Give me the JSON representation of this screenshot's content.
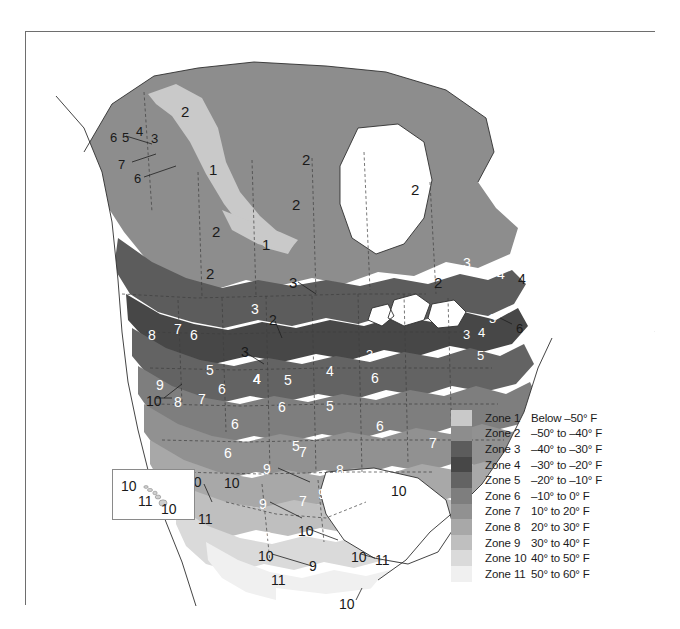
{
  "figure": {
    "kind": "choropleth-map",
    "palette": "grayscale"
  },
  "map": {
    "background_color": "#ffffff",
    "border_color": "#6e6e6e",
    "coastline_color": "#2b2b2b",
    "boundary_color": "#3a3a3a",
    "zone_fill_colors": {
      "1": "#c9c9c9",
      "2": "#8d8d8d",
      "3": "#5c5c5c",
      "4": "#4a4a4a",
      "5": "#606060",
      "6": "#7b7b7b",
      "7": "#8f8f8f",
      "8": "#a6a6a6",
      "9": "#bdbdbd",
      "10": "#d8d8d8",
      "11": "#efefef"
    },
    "labels": [
      {
        "text": "6",
        "x": 84,
        "y": 99,
        "size": 13,
        "tone": "dark"
      },
      {
        "text": "5",
        "x": 96,
        "y": 99,
        "size": 13,
        "tone": "dark"
      },
      {
        "text": "4",
        "x": 110,
        "y": 93,
        "size": 13,
        "tone": "dark"
      },
      {
        "text": "3",
        "x": 125,
        "y": 100,
        "size": 13,
        "tone": "dark"
      },
      {
        "text": "7",
        "x": 92,
        "y": 126,
        "size": 13,
        "tone": "dark"
      },
      {
        "text": "6",
        "x": 108,
        "y": 140,
        "size": 13,
        "tone": "dark"
      },
      {
        "text": "2",
        "x": 155,
        "y": 72,
        "size": 15,
        "tone": "dark"
      },
      {
        "text": "1",
        "x": 183,
        "y": 130,
        "size": 15,
        "tone": "dark"
      },
      {
        "text": "2",
        "x": 276,
        "y": 120,
        "size": 15,
        "tone": "dark"
      },
      {
        "text": "2",
        "x": 385,
        "y": 150,
        "size": 15,
        "tone": "dark"
      },
      {
        "text": "2",
        "x": 266,
        "y": 165,
        "size": 15,
        "tone": "dark"
      },
      {
        "text": "2",
        "x": 186,
        "y": 192,
        "size": 15,
        "tone": "dark"
      },
      {
        "text": "1",
        "x": 236,
        "y": 205,
        "size": 15,
        "tone": "dark"
      },
      {
        "text": "2",
        "x": 180,
        "y": 234,
        "size": 15,
        "tone": "dark"
      },
      {
        "text": "3",
        "x": 263,
        "y": 243,
        "size": 15,
        "tone": "dark"
      },
      {
        "text": "3",
        "x": 225,
        "y": 270,
        "size": 14,
        "tone": "light"
      },
      {
        "text": "2",
        "x": 243,
        "y": 281,
        "size": 14,
        "tone": "dark"
      },
      {
        "text": "3",
        "x": 385,
        "y": 267,
        "size": 14,
        "tone": "light"
      },
      {
        "text": "2",
        "x": 408,
        "y": 243,
        "size": 15,
        "tone": "dark"
      },
      {
        "text": "3",
        "x": 437,
        "y": 224,
        "size": 14,
        "tone": "light"
      },
      {
        "text": "4",
        "x": 471,
        "y": 235,
        "size": 14,
        "tone": "light"
      },
      {
        "text": "4",
        "x": 492,
        "y": 240,
        "size": 14,
        "tone": "dark"
      },
      {
        "text": "5",
        "x": 494,
        "y": 260,
        "size": 14,
        "tone": "light"
      },
      {
        "text": "3",
        "x": 463,
        "y": 280,
        "size": 13,
        "tone": "light"
      },
      {
        "text": "6",
        "x": 490,
        "y": 290,
        "size": 13,
        "tone": "dark"
      },
      {
        "text": "3",
        "x": 437,
        "y": 296,
        "size": 13,
        "tone": "light"
      },
      {
        "text": "4",
        "x": 452,
        "y": 294,
        "size": 13,
        "tone": "light"
      },
      {
        "text": "3",
        "x": 340,
        "y": 316,
        "size": 13,
        "tone": "light"
      },
      {
        "text": "5",
        "x": 451,
        "y": 317,
        "size": 13,
        "tone": "light"
      },
      {
        "text": "8",
        "x": 122,
        "y": 296,
        "size": 14,
        "tone": "light"
      },
      {
        "text": "7",
        "x": 148,
        "y": 290,
        "size": 14,
        "tone": "light"
      },
      {
        "text": "6",
        "x": 164,
        "y": 296,
        "size": 14,
        "tone": "light"
      },
      {
        "text": "3",
        "x": 215,
        "y": 313,
        "size": 14,
        "tone": "dark"
      },
      {
        "text": "5",
        "x": 180,
        "y": 331,
        "size": 14,
        "tone": "light"
      },
      {
        "text": "4",
        "x": 227,
        "y": 340,
        "size": 14,
        "tone": "light"
      },
      {
        "text": "4",
        "x": 227,
        "y": 340,
        "size": 14,
        "tone": "light"
      },
      {
        "text": "6",
        "x": 192,
        "y": 350,
        "size": 14,
        "tone": "light"
      },
      {
        "text": "4",
        "x": 227,
        "y": 340,
        "size": 14,
        "tone": "light"
      },
      {
        "text": "5",
        "x": 258,
        "y": 341,
        "size": 14,
        "tone": "light"
      },
      {
        "text": "4",
        "x": 300,
        "y": 332,
        "size": 14,
        "tone": "light"
      },
      {
        "text": "5",
        "x": 300,
        "y": 367,
        "size": 14,
        "tone": "light"
      },
      {
        "text": "6",
        "x": 252,
        "y": 368,
        "size": 14,
        "tone": "light"
      },
      {
        "text": "6",
        "x": 345,
        "y": 339,
        "size": 14,
        "tone": "light"
      },
      {
        "text": "6",
        "x": 350,
        "y": 387,
        "size": 14,
        "tone": "light"
      },
      {
        "text": "5",
        "x": 266,
        "y": 407,
        "size": 14,
        "tone": "light"
      },
      {
        "text": "6",
        "x": 205,
        "y": 385,
        "size": 14,
        "tone": "light"
      },
      {
        "text": "7",
        "x": 273,
        "y": 413,
        "size": 14,
        "tone": "light"
      },
      {
        "text": "7",
        "x": 403,
        "y": 404,
        "size": 14,
        "tone": "light"
      },
      {
        "text": "8",
        "x": 310,
        "y": 431,
        "size": 14,
        "tone": "light"
      },
      {
        "text": "9",
        "x": 130,
        "y": 346,
        "size": 14,
        "tone": "light"
      },
      {
        "text": "8",
        "x": 148,
        "y": 363,
        "size": 14,
        "tone": "light"
      },
      {
        "text": "7",
        "x": 172,
        "y": 360,
        "size": 14,
        "tone": "light"
      },
      {
        "text": "10",
        "x": 120,
        "y": 362,
        "size": 14,
        "tone": "dark"
      },
      {
        "text": "6",
        "x": 198,
        "y": 414,
        "size": 14,
        "tone": "light"
      },
      {
        "text": "9",
        "x": 237,
        "y": 430,
        "size": 14,
        "tone": "light"
      },
      {
        "text": "9",
        "x": 292,
        "y": 455,
        "size": 14,
        "tone": "light"
      },
      {
        "text": "9",
        "x": 233,
        "y": 465,
        "size": 14,
        "tone": "light"
      },
      {
        "text": "7",
        "x": 273,
        "y": 462,
        "size": 14,
        "tone": "light"
      },
      {
        "text": "10",
        "x": 365,
        "y": 452,
        "size": 14,
        "tone": "dark"
      },
      {
        "text": "10",
        "x": 198,
        "y": 444,
        "size": 14,
        "tone": "dark"
      },
      {
        "text": "11",
        "x": 172,
        "y": 480,
        "size": 14,
        "tone": "dark"
      },
      {
        "text": "10",
        "x": 160,
        "y": 443,
        "size": 14,
        "tone": "dark"
      },
      {
        "text": "8",
        "x": 238,
        "y": 498,
        "size": 14,
        "tone": "light"
      },
      {
        "text": "10",
        "x": 272,
        "y": 492,
        "size": 14,
        "tone": "dark"
      },
      {
        "text": "10",
        "x": 232,
        "y": 517,
        "size": 14,
        "tone": "dark"
      },
      {
        "text": "9",
        "x": 283,
        "y": 527,
        "size": 14,
        "tone": "dark"
      },
      {
        "text": "11",
        "x": 245,
        "y": 541,
        "size": 14,
        "tone": "dark"
      },
      {
        "text": "10",
        "x": 325,
        "y": 518,
        "size": 14,
        "tone": "dark"
      },
      {
        "text": "11",
        "x": 349,
        "y": 521,
        "size": 14,
        "tone": "dark"
      },
      {
        "text": "10",
        "x": 313,
        "y": 565,
        "size": 14,
        "tone": "dark"
      }
    ],
    "inset": {
      "name": "hawaii-inset",
      "labels": [
        {
          "text": "10",
          "x": 8,
          "y": 9,
          "size": 14,
          "tone": "dark"
        },
        {
          "text": "11",
          "x": 25,
          "y": 24,
          "size": 14,
          "tone": "dark"
        },
        {
          "text": "10",
          "x": 48,
          "y": 32,
          "size": 14,
          "tone": "dark"
        }
      ]
    }
  },
  "legend": {
    "title": "",
    "rows": [
      {
        "zone": "Zone 1",
        "range": "Below –50° F",
        "color": "#c9c9c9"
      },
      {
        "zone": "Zone 2",
        "range": "–50° to –40° F",
        "color": "#8d8d8d"
      },
      {
        "zone": "Zone 3",
        "range": "–40° to –30° F",
        "color": "#5c5c5c"
      },
      {
        "zone": "Zone 4",
        "range": "–30° to –20° F",
        "color": "#474747"
      },
      {
        "zone": "Zone 5",
        "range": "–20° to –10° F",
        "color": "#636363"
      },
      {
        "zone": "Zone 6",
        "range": "–10° to 0° F",
        "color": "#7e7e7e"
      },
      {
        "zone": "Zone 7",
        "range": "10° to 20° F",
        "color": "#919191"
      },
      {
        "zone": "Zone 8",
        "range": "20° to 30° F",
        "color": "#a8a8a8"
      },
      {
        "zone": "Zone 9",
        "range": "30° to 40° F",
        "color": "#bfbfbf"
      },
      {
        "zone": "Zone 10",
        "range": "40° to 50° F",
        "color": "#dadada"
      },
      {
        "zone": "Zone 11",
        "range": "50° to 60° F",
        "color": "#f0f0f0"
      }
    ]
  }
}
